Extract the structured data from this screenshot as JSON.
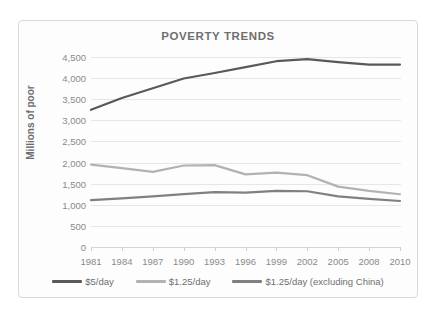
{
  "chart_data": {
    "type": "line",
    "title": "POVERTY TRENDS",
    "xlabel": "",
    "ylabel": "Millions of poor",
    "categories": [
      "1981",
      "1984",
      "1987",
      "1990",
      "1993",
      "1996",
      "1999",
      "2002",
      "2005",
      "2008",
      "2010"
    ],
    "ylim": [
      0,
      4500
    ],
    "ytick_labels": [
      "4,500",
      "4,000",
      "3,500",
      "3,000",
      "2,500",
      "2,000",
      "1,500",
      "1,000",
      "500",
      "0"
    ],
    "ytick_values": [
      4500,
      4000,
      3500,
      3000,
      2500,
      2000,
      1500,
      1000,
      500,
      0
    ],
    "grid": true,
    "legend_position": "bottom",
    "series": [
      {
        "name": "$5/day",
        "color": "#595959",
        "values": [
          3250,
          3530,
          3760,
          3990,
          4120,
          4260,
          4400,
          4450,
          4380,
          4320,
          4320
        ]
      },
      {
        "name": "$1.25/day",
        "color": "#b2b2b2",
        "values": [
          1950,
          1870,
          1780,
          1930,
          1940,
          1720,
          1760,
          1700,
          1430,
          1330,
          1250
        ]
      },
      {
        "name": "$1.25/day (excluding China)",
        "color": "#808080",
        "values": [
          1110,
          1150,
          1200,
          1250,
          1300,
          1290,
          1330,
          1320,
          1200,
          1140,
          1090
        ]
      }
    ]
  }
}
